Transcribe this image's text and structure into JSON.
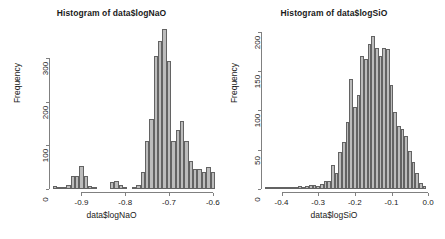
{
  "figure": {
    "background": "#ffffff",
    "bar_fill": "#bcbcbc",
    "bar_border": "#636363",
    "axis_color": "#808080",
    "text_color": "#1a1a1a"
  },
  "panels": [
    {
      "id": "logNaO",
      "title": "Histogram of data$logNaO",
      "xlabel": "data$logNaO",
      "ylabel": "Frequency"
    },
    {
      "id": "logSiO",
      "title": "Histogram of data$logSiO",
      "xlabel": "data$logSiO",
      "ylabel": "Frequency"
    }
  ],
  "chart_data": [
    {
      "type": "bar",
      "subtype": "histogram",
      "title": "Histogram of data$logNaO",
      "xlabel": "data$logNaO",
      "ylabel": "Frequency",
      "xlim": [
        -0.965,
        -0.595
      ],
      "ylim": [
        0,
        370
      ],
      "xticks": [
        -0.9,
        -0.8,
        -0.7,
        -0.6
      ],
      "xtick_labels": [
        "-0.9",
        "-0.8",
        "-0.7",
        "-0.6"
      ],
      "yticks": [
        0,
        100,
        200,
        300
      ],
      "ytick_labels": [
        "0",
        "100",
        "200",
        "300"
      ],
      "grid": false,
      "legend": false,
      "bin_width": 0.01,
      "bin_starts": [
        -0.965,
        -0.955,
        -0.945,
        -0.935,
        -0.925,
        -0.915,
        -0.905,
        -0.895,
        -0.885,
        -0.875,
        -0.865,
        -0.855,
        -0.845,
        -0.835,
        -0.825,
        -0.815,
        -0.805,
        -0.795,
        -0.785,
        -0.775,
        -0.765,
        -0.755,
        -0.745,
        -0.735,
        -0.725,
        -0.715,
        -0.705,
        -0.695,
        -0.685,
        -0.675,
        -0.665,
        -0.655,
        -0.645,
        -0.635,
        -0.625,
        -0.615,
        -0.605
      ],
      "values": [
        7,
        4,
        3,
        9,
        30,
        30,
        53,
        31,
        6,
        2,
        0,
        0,
        0,
        15,
        18,
        10,
        2,
        0,
        3,
        9,
        38,
        110,
        160,
        305,
        340,
        368,
        295,
        110,
        135,
        157,
        110,
        65,
        45,
        47,
        40,
        50,
        38
      ]
    },
    {
      "type": "bar",
      "subtype": "histogram",
      "title": "Histogram of data$logSiO",
      "xlabel": "data$logSiO",
      "ylabel": "Frequency",
      "xlim": [
        -0.445,
        0.005
      ],
      "ylim": [
        0,
        205
      ],
      "xticks": [
        -0.4,
        -0.3,
        -0.2,
        -0.1,
        0.0
      ],
      "xtick_labels": [
        "-0.4",
        "-0.3",
        "-0.2",
        "-0.1",
        "0.0"
      ],
      "yticks": [
        0,
        50,
        100,
        150,
        200
      ],
      "ytick_labels": [
        "0",
        "50",
        "100",
        "150",
        "200"
      ],
      "grid": false,
      "legend": false,
      "bin_width": 0.01,
      "bin_starts": [
        -0.445,
        -0.435,
        -0.425,
        -0.415,
        -0.405,
        -0.395,
        -0.385,
        -0.375,
        -0.365,
        -0.355,
        -0.345,
        -0.335,
        -0.325,
        -0.315,
        -0.305,
        -0.295,
        -0.285,
        -0.275,
        -0.265,
        -0.255,
        -0.245,
        -0.235,
        -0.225,
        -0.215,
        -0.205,
        -0.195,
        -0.185,
        -0.175,
        -0.165,
        -0.155,
        -0.145,
        -0.135,
        -0.125,
        -0.115,
        -0.105,
        -0.095,
        -0.085,
        -0.075,
        -0.065,
        -0.055,
        -0.045,
        -0.035,
        -0.025,
        -0.015
      ],
      "values": [
        1,
        1,
        2,
        2,
        2,
        3,
        2,
        3,
        3,
        4,
        3,
        4,
        5,
        5,
        4,
        6,
        10,
        10,
        30,
        20,
        47,
        60,
        85,
        140,
        105,
        120,
        170,
        165,
        185,
        195,
        180,
        170,
        180,
        178,
        133,
        98,
        80,
        77,
        68,
        48,
        35,
        20,
        8,
        4
      ]
    }
  ]
}
